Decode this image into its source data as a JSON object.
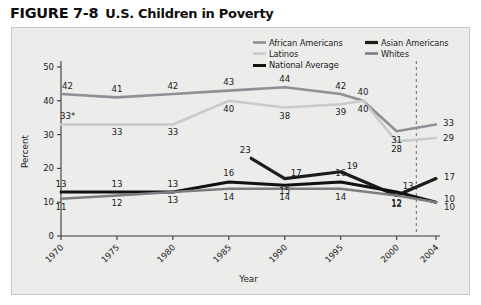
{
  "figure": {
    "number": "FIGURE 7-8",
    "title": "U.S. Children in Poverty"
  },
  "legend": {
    "position": "top-right",
    "entries": [
      {
        "label": "African Americans",
        "color": "#8e9096",
        "width": 2.6
      },
      {
        "label": "Asian Americans",
        "color": "#1c1c1c",
        "width": 3.2
      },
      {
        "label": "Latinos",
        "color": "#c9cacb",
        "width": 2.6
      },
      {
        "label": "Whites",
        "color": "#7b7d82",
        "width": 2.6
      },
      {
        "label": "National Average",
        "color": "#111111",
        "width": 3.0
      }
    ]
  },
  "chart_data": {
    "type": "line",
    "title": "U.S. Children in Poverty",
    "xlabel": "Year",
    "ylabel": "Percent",
    "ylim": [
      0,
      50
    ],
    "yticks": [
      0,
      10,
      20,
      30,
      40,
      50
    ],
    "xticks": [
      "1970",
      "1975",
      "1980",
      "1985",
      "1990",
      "1995",
      "2000",
      "2004"
    ],
    "x": [
      1970,
      1975,
      1980,
      1985,
      1990,
      1995,
      2000,
      2004
    ],
    "grid": false,
    "axis_break_before": "2004",
    "series": [
      {
        "name": "African Americans",
        "color": "#8e9096",
        "x": [
          1970,
          1975,
          1980,
          1985,
          1990,
          1995,
          1997,
          2000,
          2004
        ],
        "values": [
          42,
          41,
          42,
          43,
          44,
          42,
          40,
          31,
          33
        ],
        "labels": [
          "42",
          "41",
          "42",
          "43",
          "44",
          "42",
          "40",
          "31",
          "33"
        ]
      },
      {
        "name": "Latinos",
        "color": "#c9cacb",
        "x": [
          1970,
          1975,
          1980,
          1985,
          1990,
          1995,
          1997,
          2000,
          2004
        ],
        "values": [
          33,
          33,
          33,
          40,
          38,
          39,
          40,
          28,
          29
        ],
        "labels": [
          "33*",
          "33",
          "33",
          "40",
          "38",
          "39",
          "40",
          "28",
          "29"
        ]
      },
      {
        "name": "Asian Americans",
        "color": "#1c1c1c",
        "x": [
          1987,
          1990,
          1995,
          2000,
          2004
        ],
        "values": [
          23,
          17,
          19,
          12,
          17
        ],
        "labels": [
          "23",
          "17",
          "19",
          "12",
          "17"
        ]
      },
      {
        "name": "National Average",
        "color": "#111111",
        "x": [
          1970,
          1975,
          1980,
          1985,
          1990,
          1995,
          2000,
          2004
        ],
        "values": [
          13,
          13,
          13,
          16,
          15,
          16,
          13,
          10
        ],
        "labels": [
          "13",
          "13",
          "13",
          "16",
          "15",
          "16",
          "13",
          "10"
        ]
      },
      {
        "name": "Whites",
        "color": "#7b7d82",
        "x": [
          1970,
          1975,
          1980,
          1985,
          1990,
          1995,
          2000,
          2004
        ],
        "values": [
          11,
          12,
          13,
          14,
          14,
          14,
          12,
          10
        ],
        "labels": [
          "11",
          "12",
          "13",
          "14",
          "14",
          "14",
          "12",
          "10"
        ]
      }
    ]
  },
  "colors": {
    "panel_bg": "#ececea",
    "panel_border": "#c9c9c5",
    "axis": "#3a3a3a",
    "text": "#1b1b1b"
  }
}
